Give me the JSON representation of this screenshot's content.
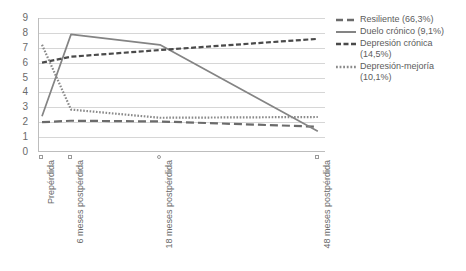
{
  "chart_data": {
    "type": "line",
    "title": "",
    "subtitle": "",
    "xlabel": "",
    "ylabel": "",
    "ylim": [
      0,
      9
    ],
    "yticks": [
      0,
      1,
      2,
      3,
      4,
      5,
      6,
      7,
      8,
      9
    ],
    "grid": true,
    "legend_position": "right",
    "categories": [
      "Prepérdida",
      "6 meses postpérdida",
      "18 meses postpérdida",
      "48 meses postpérdida"
    ],
    "series": [
      {
        "name": "Resiliente (66,3%)",
        "label": "Resiliente",
        "percent": "66,3%",
        "style": "long-dash",
        "color": "#6b6b6b",
        "values": [
          2.0,
          2.1,
          2.05,
          1.7
        ]
      },
      {
        "name": "Duelo crónico (9,1%)",
        "label": "Duelo crónico",
        "percent": "9,1%",
        "style": "solid",
        "color": "#848484",
        "values": [
          2.4,
          7.9,
          7.2,
          1.4
        ]
      },
      {
        "name": "Depresión crónica (14,5%)",
        "label": "Depresión crónica",
        "percent": "14,5%",
        "style": "dash",
        "color": "#4a4a4a",
        "values": [
          6.0,
          6.4,
          6.85,
          7.6
        ]
      },
      {
        "name": "Depresión-mejoría (10,1%)",
        "label": "Depresión-mejoría",
        "percent": "10,1%",
        "style": "dotted",
        "color": "#8a8a8a",
        "values": [
          7.2,
          2.85,
          2.3,
          2.35
        ]
      }
    ]
  },
  "y_axis": {
    "ticks": [
      "9",
      "8",
      "7",
      "6",
      "5",
      "4",
      "3",
      "2",
      "1",
      "0"
    ]
  },
  "x_axis": {
    "labels": [
      "Prepérdida",
      "6 meses postpérdida",
      "18 meses postpérdida",
      "48 meses postpérdida"
    ]
  },
  "legend": {
    "items": [
      {
        "text": "Resiliente (66,3%)",
        "marker": "long-dash"
      },
      {
        "text": "Duelo crónico (9,1%)",
        "marker": "solid"
      },
      {
        "text": "Depresión crónica\n(14,5%)",
        "marker": "dash"
      },
      {
        "text": "Depresión-mejoría\n(10,1%)",
        "marker": "dotted"
      }
    ]
  }
}
